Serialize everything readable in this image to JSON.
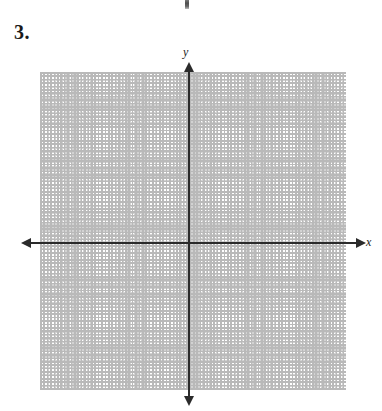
{
  "worksheet": {
    "problem_number": "3."
  },
  "artifact": {
    "name": "cropped-arrow-tip-above",
    "visible": true
  },
  "graph": {
    "axes": {
      "x_label": "x",
      "y_label": "y",
      "origin_px": {
        "x": 189,
        "y": 243
      },
      "arrowheads": [
        "left",
        "right",
        "up",
        "down"
      ],
      "color": "#2b2b2b"
    },
    "grid": {
      "style": "dotted",
      "minor_spacing_px": 10.2,
      "major_spacing_px": 20.4,
      "minor_color": "#d2d2d2",
      "major_color": "#b9b9b9",
      "bounds_px": {
        "left": 40,
        "top": 72,
        "right": 346,
        "bottom": 390
      },
      "columns": 30,
      "rows": 31,
      "tick_labels": [],
      "plotted_points": [],
      "plotted_curves": []
    }
  },
  "chart_data": {
    "type": "scatter",
    "title": "",
    "xlabel": "x",
    "ylabel": "y",
    "x": [],
    "y": [],
    "series": [],
    "xlim": [
      -14.6,
      15.4
    ],
    "ylim": [
      -15.4,
      16.8
    ],
    "grid": true,
    "legend": "none",
    "note": "Blank Cartesian coordinate grid — no data plotted; worksheet problem 3."
  }
}
